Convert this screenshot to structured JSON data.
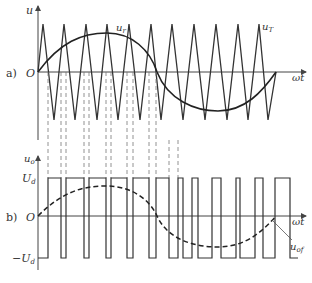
{
  "panel_a": {
    "label": "a)",
    "y_axis_label": "u",
    "origin_label": "O",
    "x_axis_label": "ωt",
    "reference_label": "u",
    "reference_sub": "r",
    "carrier_label": "u",
    "carrier_sub": "T"
  },
  "panel_b": {
    "label": "b)",
    "y_axis_label": "u",
    "y_axis_sub": "o",
    "origin_label": "O",
    "x_axis_label": "ωt",
    "pos_level_label": "U",
    "pos_level_sub": "d",
    "neg_level_label": "−U",
    "neg_level_sub": "d",
    "fundamental_label": "u",
    "fundamental_sub": "of"
  },
  "colors": {
    "line": "#333333",
    "axis": "#444444",
    "dashed": "#777777"
  },
  "waveform": {
    "carrier_peaks_x": [
      43,
      64,
      86,
      107,
      129,
      151,
      172,
      194,
      216,
      238,
      259,
      276
    ],
    "carrier_troughs_x": [
      54,
      75,
      97,
      118,
      140,
      161,
      183,
      205,
      227,
      248,
      268
    ],
    "pulse_edges_x": [
      38,
      48,
      61,
      66,
      84,
      89,
      106,
      111,
      127,
      133,
      149,
      156,
      169,
      178,
      192,
      198,
      212,
      221,
      236,
      240,
      255,
      263,
      277,
      290
    ]
  }
}
